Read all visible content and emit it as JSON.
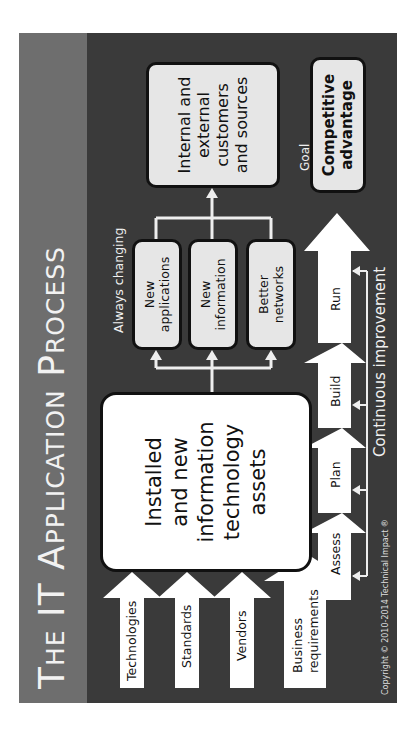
{
  "title": "The IT Application Process",
  "inputs": [
    {
      "label": "Technologies"
    },
    {
      "label": "Standards"
    },
    {
      "label": "Vendors"
    },
    {
      "label_line1": "Business",
      "label_line2": "requirements"
    }
  ],
  "assets_box": {
    "line1": "Installed",
    "line2": "and new",
    "line3": "information",
    "line4": "technology",
    "line5": "assets"
  },
  "always_changing": {
    "label": "Always changing",
    "boxes": [
      {
        "line1": "New",
        "line2": "applications"
      },
      {
        "line1": "New",
        "line2": "information"
      },
      {
        "line1": "Better",
        "line2": "networks"
      }
    ]
  },
  "goal": {
    "label": "Goal",
    "box_line1": "Internal and",
    "box_line2": "external",
    "box_line3": "customers",
    "box_line4": "and sources"
  },
  "competitive": {
    "line1": "Competitive",
    "line2": "advantage"
  },
  "cycle": {
    "steps": [
      "Assess",
      "Plan",
      "Build",
      "Run"
    ],
    "label": "Continuous improvement"
  },
  "copyright": "Copyright © 2010-2014 Technical Impact ®",
  "colors": {
    "background": "#3a3a3a",
    "title_band": "#6e6e6e",
    "box_light": "#e6e6e6",
    "box_white": "#ffffff",
    "arrow": "#ffffff"
  }
}
